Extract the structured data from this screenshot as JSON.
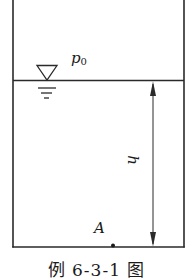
{
  "diagram": {
    "type": "tank-hydrostatics",
    "labels": {
      "surface_pressure": "p",
      "surface_pressure_subscript": "0",
      "depth": "h",
      "point": "A"
    },
    "caption": "例 6-3-1 图",
    "colors": {
      "line": "#2a2a2a",
      "text": "#1a1a1a",
      "background": "#ffffff"
    },
    "geometry": {
      "tank_left_x": 13,
      "tank_right_x": 184,
      "tank_top_y": 0,
      "free_surface_y": 80,
      "tank_bottom_y": 247,
      "dimension_arrow_x": 153,
      "point_A": {
        "x": 113,
        "y": 246
      }
    },
    "elements": [
      {
        "name": "tank-walls",
        "description": "open-top rectangular container (left, right, bottom walls)"
      },
      {
        "name": "free-surface-line",
        "description": "horizontal liquid free surface"
      },
      {
        "name": "water-level-symbol",
        "description": "inverted triangle with three decreasing dashes (free-surface marker)"
      },
      {
        "name": "depth-dimension-arrow",
        "description": "double-headed vertical arrow from free surface to bottom labeled h"
      },
      {
        "name": "point-A-marker",
        "description": "dot on the tank bottom labeled A"
      }
    ]
  }
}
